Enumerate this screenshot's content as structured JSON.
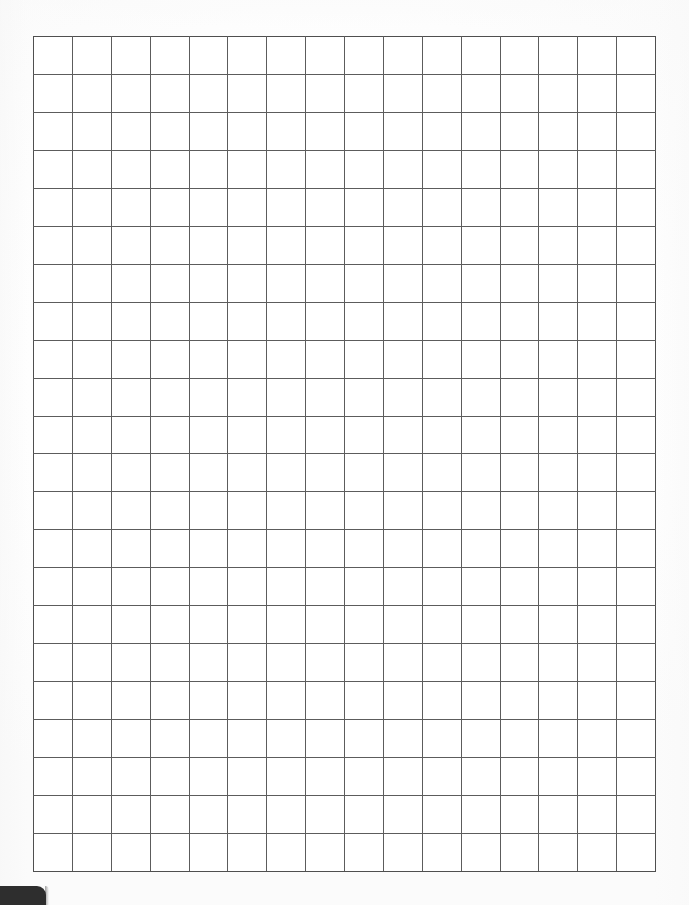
{
  "document": {
    "kind": "blank-graph-paper",
    "page_width": 689,
    "page_height": 905,
    "background_color": "#ffffff",
    "alt_text": "Blank square grid / graph paper sheet"
  },
  "grid": {
    "columns": 16,
    "rows": 22,
    "left": 33,
    "top": 36,
    "width": 623,
    "height": 836,
    "cell_width": 38.9,
    "cell_height": 38.0,
    "line_color": "#5c5c5c",
    "frame_color": "#4f4f4f",
    "line_width": 1,
    "cell_fill": "#ffffff",
    "cell_label": ""
  },
  "corner_tab": {
    "visible": true,
    "left": 0,
    "top": 886,
    "width": 46,
    "height": 19,
    "color": "#2e2e2e",
    "corner_radius": 9
  },
  "chart_data": {
    "type": "table",
    "title": "",
    "subtitle": "",
    "xlabel": "",
    "ylabel": "",
    "columns": 16,
    "rows": 22,
    "categories": [],
    "values": [],
    "grid": true,
    "legend": "none",
    "annotations": []
  }
}
